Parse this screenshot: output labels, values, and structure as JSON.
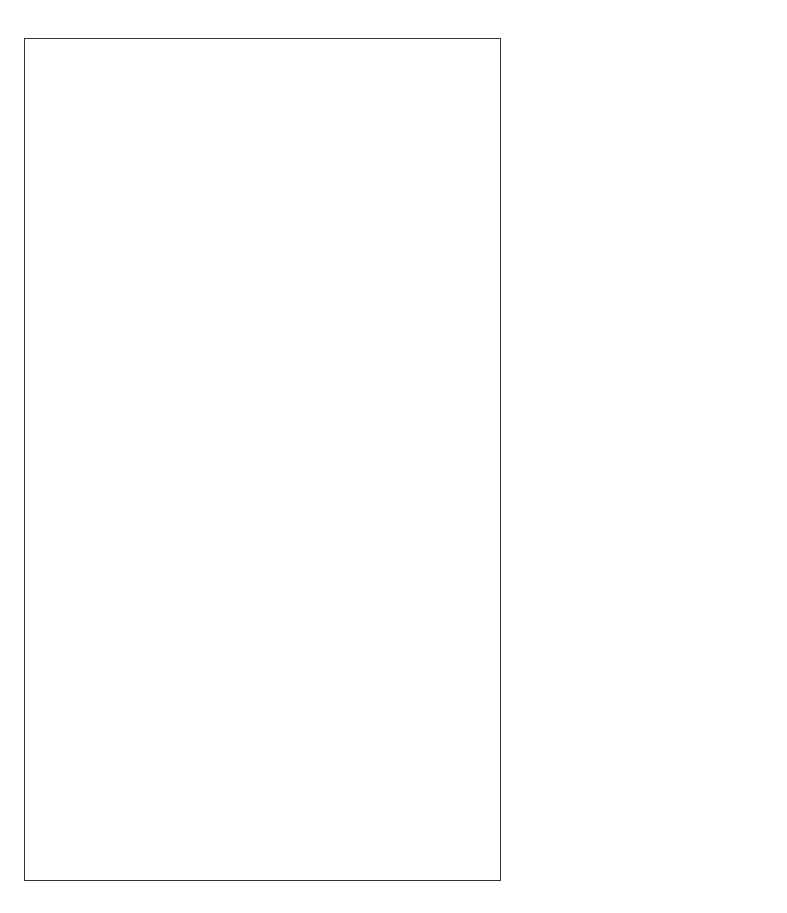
{
  "diagram": {
    "nodes": {
      "source_line1": "Excessive alcohol drinking",
      "source_line2": "tobacco smoking",
      "ros_line1": "Reactive oxygen",
      "ros_line2": "species generation",
      "cyp2e1": "CYP2E1 induction",
      "inhibition_line1": "Inhibition of",
      "inhibition_line2": "retinoic acid",
      "inhibition_line3": "biosynthesis",
      "oxidative_line1": "Oxidative",
      "oxidative_line2": "stress",
      "enhancement_line1": "Enhancement",
      "enhancement_line2": "of retinoic acid",
      "enhancement_line3": "degradation",
      "mapk_line1": "MAPKs signaling",
      "mapk_line2_a": "(JNK, ",
      "mapk_line2_italic": "p38",
      "mapk_line2_b": ", and ERK)",
      "activation_line1": "Activation of",
      "activation_line2": "procarcinogens",
      "retinoic_acid": "Retinoic acid",
      "phosphorylation": "Phosphorylation",
      "cfos": "c-Fos",
      "cjun": "c-Jun",
      "ap1": "AP-1",
      "crosstalk_line1": "Alteration of ‘cross-talk’",
      "crosstalk_line2": "homeostasis",
      "rxr": "RXR",
      "rar": "RAR",
      "transformation": "Transformation",
      "inflammation": "Inflammation",
      "proliferation": "Proliferation",
      "apoptosis": "Apoptosis",
      "immune_line1": "Immune",
      "immune_line2": "function",
      "promote": "Promote",
      "carcinogenesis": "Carcinogenesis"
    },
    "carcinogens": {
      "heading": "Carcinogens",
      "items": [
        "Acetaldehyde, Aflatoxin",
        "Diethylnitrosamine"
      ],
      "nnk_a": "4-(",
      "nnk_n1": "N",
      "nnk_b": "-Methyl-",
      "nnk_n2": "N",
      "nnk_c": "-nitrosamino)-",
      "nnk_line2": "1-(3-pyridyl)-1-butanone",
      "last": "Polycyclic aromatic hydrocarbons, etc."
    },
    "indicators": {
      "mapk": "up",
      "ap1": "up",
      "retinoic_acid": "down",
      "rxr_rar": "down",
      "transformation": "up",
      "inflammation": "up",
      "proliferation": "up",
      "apoptosis": "down",
      "immune_function": "down"
    },
    "colors": {
      "line": "#1a1a1a",
      "background": "#ffffff"
    }
  }
}
